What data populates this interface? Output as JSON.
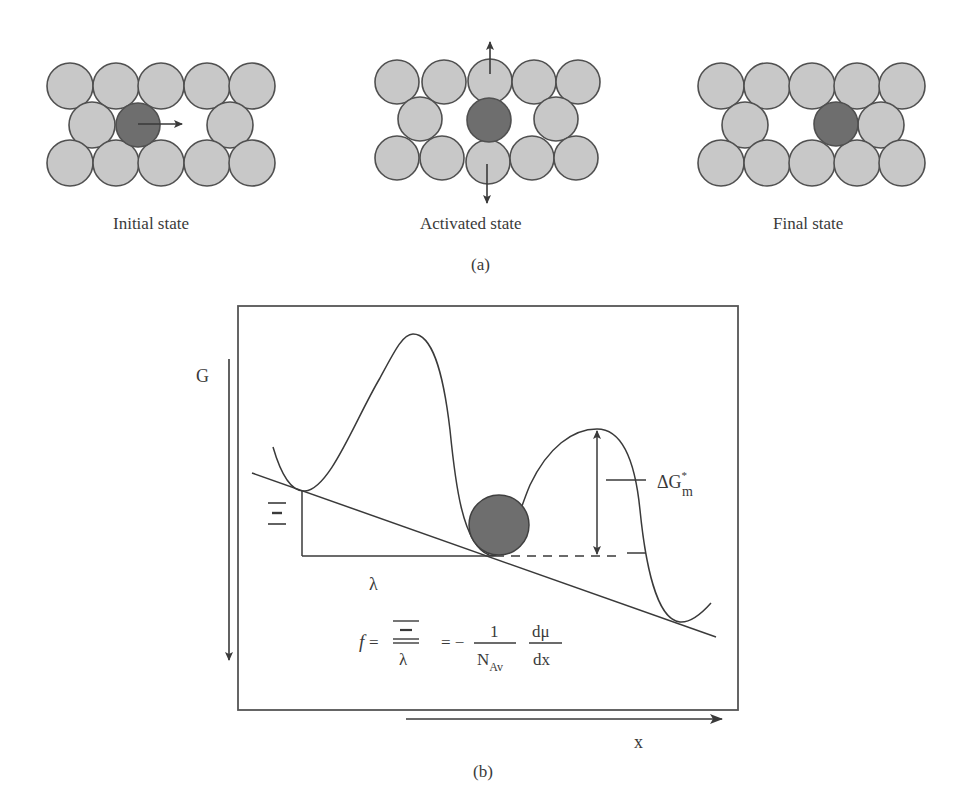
{
  "panel_a": {
    "caption": "(a)",
    "states": [
      {
        "label": "Initial state",
        "moving_atom_arrow": "right"
      },
      {
        "label": "Activated state",
        "neighbor_arrows": [
          "up",
          "down"
        ]
      },
      {
        "label": "Final state"
      }
    ]
  },
  "panel_b": {
    "caption": "(b)",
    "y_axis_label": "G",
    "x_axis_label": "x",
    "barrier_label": "ΔG",
    "barrier_superscript": "*",
    "barrier_subscript": "m",
    "force_label": "Ξ",
    "distance_label": "λ",
    "equation": {
      "lhs": "f",
      "eq1": "=",
      "frac1_num": "Ξ",
      "frac1_den": "λ",
      "eq2": "= −",
      "frac2_num": "1",
      "frac2_den": "N",
      "frac2_den_sub": "Av",
      "frac3_num": "dμ",
      "frac3_den": "dx"
    }
  },
  "colors": {
    "atom_fill": "#c8c8c8",
    "atom_stroke": "#505050",
    "moving_atom_fill": "#6e6e6e",
    "line": "#3a3a3a"
  }
}
